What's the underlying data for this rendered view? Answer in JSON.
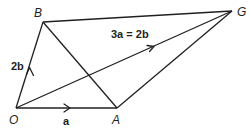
{
  "diagram": {
    "type": "vector-geometry",
    "points": {
      "O": {
        "label": "O",
        "x": 16,
        "y": 108
      },
      "A": {
        "label": "A",
        "x": 117,
        "y": 108
      },
      "B": {
        "label": "B",
        "x": 43,
        "y": 22
      },
      "G": {
        "label": "G",
        "x": 232,
        "y": 11
      }
    },
    "segments": [
      {
        "from": "O",
        "to": "A",
        "arrow": true,
        "label": "a"
      },
      {
        "from": "O",
        "to": "B",
        "arrow": true,
        "label": "2b"
      },
      {
        "from": "O",
        "to": "G",
        "arrow": true,
        "label": "3a = 2b"
      },
      {
        "from": "B",
        "to": "G",
        "arrow": false
      },
      {
        "from": "A",
        "to": "G",
        "arrow": false
      },
      {
        "from": "B",
        "to": "A",
        "arrow": false
      }
    ],
    "labels": {
      "O": "O",
      "A": "A",
      "B": "B",
      "G": "G",
      "vec_OA": "a",
      "vec_OB": "2b",
      "vec_OG": "3a = 2b"
    },
    "colors": {
      "ink": "#231f20",
      "background": "#ffffff"
    }
  }
}
